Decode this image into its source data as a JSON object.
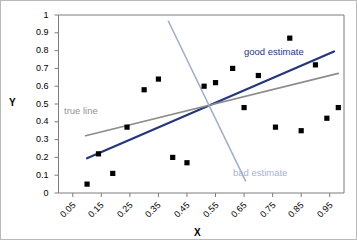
{
  "chart_data": {
    "type": "scatter",
    "title": "",
    "xlabel": "X",
    "ylabel": "Y",
    "xlim": [
      0.0,
      1.0
    ],
    "ylim": [
      0.0,
      1.0
    ],
    "grid": false,
    "legend_position": "inline-annotations",
    "x_tick_labels": [
      "0.05",
      "0.15",
      "0.25",
      "0.35",
      "0.45",
      "0.55",
      "0.65",
      "0.75",
      "0.85",
      "0.95"
    ],
    "x_tick_values": [
      0.05,
      0.15,
      0.25,
      0.35,
      0.45,
      0.55,
      0.65,
      0.75,
      0.85,
      0.95
    ],
    "y_tick_labels": [
      "0",
      "0.1",
      "0.2",
      "0.3",
      "0.4",
      "0.5",
      "0.6",
      "0.7",
      "0.8",
      "0.9",
      "1"
    ],
    "y_tick_values": [
      0,
      0.1,
      0.2,
      0.3,
      0.4,
      0.5,
      0.6,
      0.7,
      0.8,
      0.9,
      1
    ],
    "points": [
      {
        "x": 0.1,
        "y": 0.05
      },
      {
        "x": 0.14,
        "y": 0.22
      },
      {
        "x": 0.19,
        "y": 0.11
      },
      {
        "x": 0.24,
        "y": 0.37
      },
      {
        "x": 0.3,
        "y": 0.58
      },
      {
        "x": 0.35,
        "y": 0.64
      },
      {
        "x": 0.4,
        "y": 0.2
      },
      {
        "x": 0.45,
        "y": 0.17
      },
      {
        "x": 0.51,
        "y": 0.6
      },
      {
        "x": 0.55,
        "y": 0.62
      },
      {
        "x": 0.61,
        "y": 0.7
      },
      {
        "x": 0.65,
        "y": 0.48
      },
      {
        "x": 0.7,
        "y": 0.66
      },
      {
        "x": 0.76,
        "y": 0.37
      },
      {
        "x": 0.81,
        "y": 0.87
      },
      {
        "x": 0.85,
        "y": 0.35
      },
      {
        "x": 0.9,
        "y": 0.72
      },
      {
        "x": 0.94,
        "y": 0.42
      },
      {
        "x": 0.98,
        "y": 0.48
      }
    ],
    "point_marker": "filled-square",
    "point_color": "#000000",
    "lines": [
      {
        "name": "good estimate",
        "label": "good estimate",
        "color": "#24377a",
        "width": 2.2,
        "x0": 0.1,
        "y0": 0.195,
        "x1": 0.965,
        "y1": 0.795
      },
      {
        "name": "true line",
        "label": "true line",
        "color": "#8c8c8c",
        "width": 1.6,
        "x0": 0.095,
        "y0": 0.322,
        "x1": 0.98,
        "y1": 0.672
      },
      {
        "name": "bad estimate",
        "label": "bad estimate",
        "color": "#a3b0cb",
        "width": 1.6,
        "x0": 0.385,
        "y0": 0.965,
        "x1": 0.655,
        "y1": 0.068
      }
    ]
  },
  "axes": {
    "y_title": "Y",
    "x_title": "X"
  },
  "annotations": {
    "good_estimate": "good estimate",
    "true_line": "true line",
    "bad_estimate": "bad estimate"
  },
  "colors": {
    "good_estimate": "#24377a",
    "true_line": "#8c8c8c",
    "bad_estimate": "#a3b0cb",
    "axis": "#7d7d7d",
    "frame": "#b9b9b9",
    "marker": "#000000"
  }
}
